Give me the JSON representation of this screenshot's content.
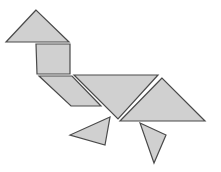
{
  "figure": {
    "fill": "#d0d0d0",
    "stroke": "#4a4a4a",
    "background": "#ffffff",
    "pieces": [
      {
        "name": "head-triangle",
        "shape": "triangle",
        "points": "36,10 6,42 69,42"
      },
      {
        "name": "neck-square",
        "shape": "square",
        "points": "36,44 70,44 70,74 37,74"
      },
      {
        "name": "body-parallelogram",
        "shape": "parallelogram",
        "points": "39,76 72,76 101,106 71,106"
      },
      {
        "name": "body-large-triangle-inverted",
        "shape": "triangle",
        "points": "74,75 158,75 118,119"
      },
      {
        "name": "tail-large-triangle",
        "shape": "triangle",
        "points": "162,78 120,121 205,121"
      },
      {
        "name": "left-leg-small-triangle",
        "shape": "triangle",
        "points": "110,117 70,135 105,145"
      },
      {
        "name": "right-leg-small-triangle",
        "shape": "triangle",
        "points": "140,123 166,135 154,163"
      }
    ]
  }
}
